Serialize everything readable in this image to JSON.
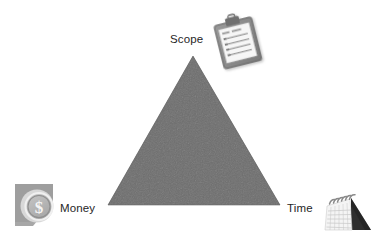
{
  "diagram": {
    "background_color": "#ffffff",
    "triangle": {
      "name": "project-triangle",
      "fill_color": "#6e6e6e",
      "texture": "subtle-noise",
      "apex": {
        "x": 193,
        "y": 56
      },
      "bottom_left": {
        "x": 108,
        "y": 205
      },
      "bottom_right": {
        "x": 280,
        "y": 205
      }
    },
    "vertices": [
      {
        "id": "scope",
        "label": "Scope",
        "position": "top",
        "label_color": "#262626",
        "icon": "clipboard-icon"
      },
      {
        "id": "money",
        "label": "Money",
        "position": "bottom-left",
        "label_color": "#262626",
        "icon": "money-coin-icon"
      },
      {
        "id": "time",
        "label": "Time",
        "position": "bottom-right",
        "label_color": "#262626",
        "icon": "desk-calendar-icon"
      }
    ],
    "icons": {
      "clipboard": {
        "name": "clipboard-icon",
        "body_color": "#8c8c8c",
        "paper_color": "#f4f4f4",
        "clip_color": "#707070",
        "line_count": 4
      },
      "money": {
        "name": "money-coin-icon",
        "coin_color": "#b5b5b5",
        "symbol": "$",
        "backdrop_color": "#9a9a9a"
      },
      "calendar": {
        "name": "desk-calendar-icon",
        "page_color": "#f2f2f2",
        "shadow_color": "#2b2b2b",
        "ring_count": 6,
        "ring_color": "#8a8a8a"
      }
    }
  }
}
